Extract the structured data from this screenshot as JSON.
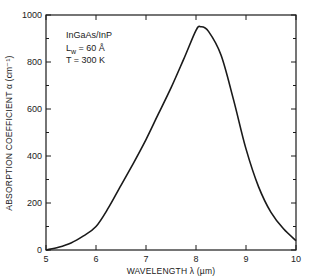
{
  "chart_data": {
    "type": "line",
    "title": "",
    "xlabel": "WAVELENGTH  λ (µm)",
    "ylabel": "ABSORPTION COEFFICIENT α (cm⁻¹)",
    "xlim": [
      5,
      10
    ],
    "ylim": [
      0,
      1000
    ],
    "x_ticks": [
      5,
      6,
      7,
      8,
      9,
      10
    ],
    "x_tick_labels": [
      "5",
      "6",
      "7",
      "8",
      "9",
      "10"
    ],
    "y_ticks": [
      0,
      200,
      400,
      600,
      800,
      1000
    ],
    "y_tick_labels": [
      "0",
      "200",
      "400",
      "600",
      "800",
      "1000"
    ],
    "grid": false,
    "legend": null,
    "annotations": [
      "InGaAs/InP",
      "L_w = 60 Å",
      "T = 300 K"
    ],
    "series": [
      {
        "name": "absorption",
        "x": [
          5.0,
          5.25,
          5.5,
          5.75,
          6.0,
          6.25,
          6.5,
          6.75,
          7.0,
          7.25,
          7.5,
          7.75,
          8.0,
          8.1,
          8.25,
          8.5,
          8.75,
          9.0,
          9.25,
          9.5,
          9.75,
          10.0
        ],
        "y": [
          0,
          12,
          30,
          60,
          100,
          180,
          275,
          370,
          470,
          580,
          690,
          810,
          935,
          950,
          930,
          830,
          640,
          430,
          270,
          160,
          90,
          40
        ]
      }
    ]
  },
  "annotation": {
    "line1": "InGaAs/InP",
    "line2_main": "L",
    "line2_sub": "w",
    "line2_rest": " = 60 Å",
    "line3": "T = 300 K"
  }
}
